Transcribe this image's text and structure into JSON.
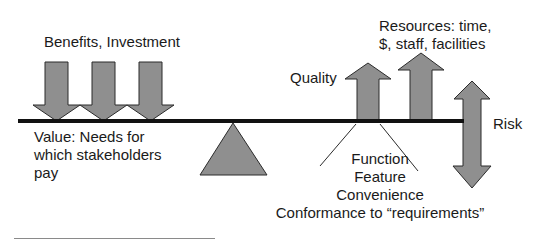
{
  "diagram": {
    "type": "balance-scale",
    "colors": {
      "shape_fill": "#8f8f8f",
      "shape_stroke": "#2b2b2b",
      "beam": "#111111",
      "text": "#1a1a1a",
      "background": "#ffffff"
    },
    "labels": {
      "benefits": "Benefits, Investment",
      "value_line1": "Value: Needs for",
      "value_line2": "which stakeholders",
      "value_line3": "pay",
      "quality": "Quality",
      "resources_line1": "Resources: time,",
      "resources_line2": "$, staff, facilities",
      "risk": "Risk",
      "quality_aspects": [
        "Function",
        "Feature",
        "Convenience",
        "Conformance to “requirements”"
      ]
    },
    "elements": {
      "left_side_arrows": {
        "direction": "down",
        "count": 3
      },
      "right_side_arrows": [
        {
          "name": "Quality",
          "direction": "up"
        },
        {
          "name": "Resources",
          "direction": "up"
        },
        {
          "name": "Risk",
          "direction": "both"
        }
      ],
      "fulcrum": "triangle"
    }
  }
}
